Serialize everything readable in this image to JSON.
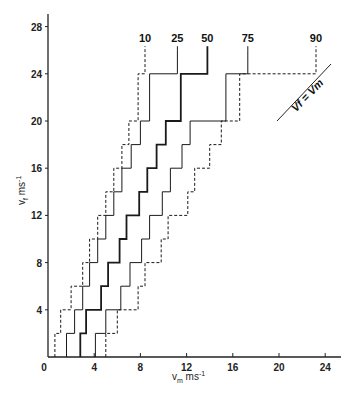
{
  "chart_data": {
    "type": "line",
    "title": "",
    "xlabel": "v_m ms^-1",
    "ylabel": "v_f ms^-1",
    "xlim": [
      0,
      25
    ],
    "ylim": [
      0,
      29
    ],
    "x_ticks": [
      0,
      4,
      8,
      12,
      16,
      20,
      24
    ],
    "y_ticks": [
      4,
      8,
      12,
      16,
      20,
      24,
      28
    ],
    "x_tick_labels": [
      "0",
      "4",
      "8",
      "12",
      "16",
      "20",
      "24"
    ],
    "y_tick_labels": [
      "4",
      "8",
      "12",
      "16",
      "20",
      "24",
      "28"
    ],
    "grid": false,
    "step_bands_vf": [
      0,
      2,
      4,
      6,
      8,
      10,
      12,
      14,
      16,
      18,
      20,
      24,
      26
    ],
    "series": [
      {
        "name": "10",
        "style": "dashed",
        "weight": "normal",
        "vm_per_band": [
          0.6,
          1.1,
          2.0,
          3.0,
          3.6,
          4.3,
          5.0,
          5.7,
          6.4,
          7.0,
          7.8,
          8.4
        ]
      },
      {
        "name": "25",
        "style": "solid",
        "weight": "normal",
        "vm_per_band": [
          1.6,
          2.3,
          3.0,
          3.6,
          4.3,
          5.0,
          5.7,
          6.4,
          7.2,
          8.0,
          8.8,
          11.2
        ]
      },
      {
        "name": "50",
        "style": "solid",
        "weight": "bold",
        "vm_per_band": [
          2.8,
          3.3,
          4.6,
          5.2,
          6.2,
          6.8,
          7.9,
          8.6,
          9.4,
          10.2,
          11.5,
          13.8
        ]
      },
      {
        "name": "75",
        "style": "solid",
        "weight": "normal",
        "vm_per_band": [
          4.1,
          5.0,
          6.3,
          7.1,
          8.1,
          8.8,
          9.9,
          10.6,
          11.6,
          12.3,
          15.4,
          17.3
        ]
      },
      {
        "name": "90",
        "style": "dashed",
        "weight": "normal",
        "vm_per_band": [
          5.0,
          6.0,
          7.8,
          8.4,
          9.8,
          10.4,
          12.1,
          12.7,
          14.0,
          15.0,
          16.6,
          23.2
        ]
      }
    ],
    "annotations": [
      {
        "text": "Vf = Vm",
        "type": "reference-line",
        "from": [
          20.1,
          20.1
        ],
        "to": [
          24.8,
          24.9
        ]
      }
    ],
    "legend": "inline labels at top of each curve (percentiles)"
  },
  "labels": {
    "xlabel": "v",
    "xlabel_sub": "m",
    "xlabel_unit": " ms",
    "xlabel_exp": "-1",
    "ylabel": "v",
    "ylabel_sub": "f",
    "ylabel_unit": " ms",
    "ylabel_exp": "-1",
    "identity_line_label": "Vf = Vm"
  }
}
